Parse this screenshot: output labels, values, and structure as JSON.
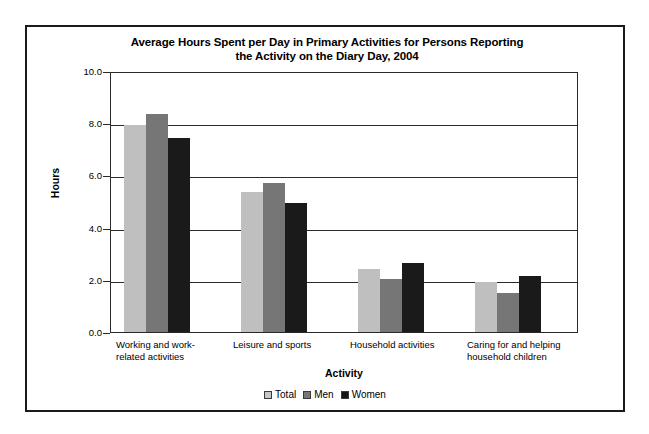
{
  "chart_data": {
    "type": "bar",
    "title": "Average Hours Spent per Day in Primary Activities for Persons Reporting the Activity on the Diary Day, 2004",
    "title_lines": [
      "Average Hours Spent per Day in Primary Activities for Persons Reporting",
      "the Activity on the Diary Day, 2004"
    ],
    "xlabel": "Activity",
    "ylabel": "Hours",
    "ylim": [
      0.0,
      10.0
    ],
    "ytick_labels": [
      "10.0",
      "8.0",
      "6.0",
      "4.0",
      "2.0",
      "0.0"
    ],
    "ytick_values": [
      10.0,
      8.0,
      6.0,
      4.0,
      2.0,
      0.0
    ],
    "grid": true,
    "legend_position": "bottom",
    "categories": [
      "Working and work-related activities",
      "Leisure and sports",
      "Household activities",
      "Caring for and helping household children"
    ],
    "category_label_lines": [
      [
        "Working and work-",
        "related activities"
      ],
      [
        "Leisure and sports"
      ],
      [
        "Household activities"
      ],
      [
        "Caring for and helping",
        "household children"
      ]
    ],
    "series": [
      {
        "name": "Total",
        "color": "#bfbfbf",
        "values": [
          7.95,
          5.35,
          2.4,
          1.9
        ]
      },
      {
        "name": "Men",
        "color": "#767676",
        "values": [
          8.35,
          5.7,
          2.05,
          1.5
        ]
      },
      {
        "name": "Women",
        "color": "#1a1a1a",
        "values": [
          7.45,
          4.95,
          2.65,
          2.15
        ]
      }
    ]
  },
  "legend": {
    "items": [
      {
        "label": "Total",
        "swatch": "total"
      },
      {
        "label": "Men",
        "swatch": "men"
      },
      {
        "label": "Women",
        "swatch": "women"
      }
    ]
  }
}
